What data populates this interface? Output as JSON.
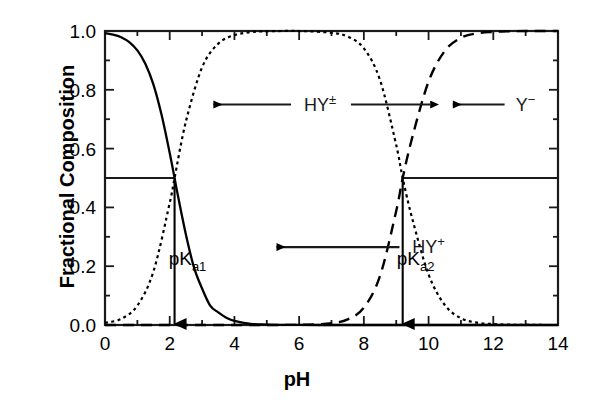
{
  "chart_data": {
    "type": "line",
    "title": "",
    "xlabel": "pH",
    "ylabel": "Fractional Composition",
    "xlim": [
      0,
      14
    ],
    "ylim": [
      0.0,
      1.0
    ],
    "xticks": [
      0,
      2,
      4,
      6,
      8,
      10,
      12,
      14
    ],
    "xtick_labels": [
      "0",
      "2",
      "4",
      "6",
      "8",
      "10",
      "12",
      "14"
    ],
    "yticks": [
      0.0,
      0.2,
      0.4,
      0.6,
      0.8,
      1.0
    ],
    "ytick_labels": [
      "0.0",
      "0.2",
      "0.4",
      "0.6",
      "0.8",
      "1.0"
    ],
    "x_minor_tick_step": 1,
    "y_minor_tick_step": 0.1,
    "grid": false,
    "legend": "none",
    "pka1": 2.15,
    "pka2": 9.2,
    "half_line_level": 0.5,
    "series": [
      {
        "name": "HY+",
        "label": "HY",
        "charge": "+",
        "style": "solid",
        "color": "#000000",
        "x": [
          0.0,
          0.25,
          0.5,
          0.75,
          1.0,
          1.25,
          1.5,
          1.75,
          2.0,
          2.15,
          2.25,
          2.5,
          2.75,
          3.0,
          3.25,
          3.5,
          3.75,
          4.0,
          4.5,
          5.0,
          5.5,
          6.0,
          7.0,
          8.0,
          9.0,
          10.0,
          11.0,
          12.0,
          13.0,
          14.0
        ],
        "values": [
          0.993,
          0.988,
          0.979,
          0.962,
          0.934,
          0.888,
          0.817,
          0.714,
          0.585,
          0.5,
          0.442,
          0.308,
          0.196,
          0.124,
          0.066,
          0.043,
          0.025,
          0.014,
          0.004,
          0.0015,
          0.0004,
          0.0001,
          0.0,
          0.0,
          0.0,
          0.0,
          0.0,
          0.0,
          0.0,
          0.0
        ]
      },
      {
        "name": "HY±",
        "label": "HY",
        "charge": "±",
        "style": "dotted",
        "color": "#000000",
        "x": [
          0.0,
          0.5,
          1.0,
          1.5,
          2.0,
          2.15,
          2.5,
          3.0,
          3.5,
          4.0,
          4.5,
          5.0,
          6.0,
          7.0,
          7.5,
          8.0,
          8.5,
          9.0,
          9.2,
          9.5,
          10.0,
          10.5,
          11.0,
          11.5,
          12.0,
          12.5,
          13.0,
          14.0
        ],
        "values": [
          0.007,
          0.021,
          0.066,
          0.183,
          0.415,
          0.5,
          0.692,
          0.876,
          0.957,
          0.986,
          0.996,
          0.999,
          1.0,
          0.994,
          0.981,
          0.941,
          0.833,
          0.612,
          0.5,
          0.36,
          0.172,
          0.068,
          0.023,
          0.008,
          0.003,
          0.001,
          0.0003,
          0.0
        ],
        "plateau_range": [
          5.0,
          7.0
        ]
      },
      {
        "name": "Y-",
        "label": "Y",
        "charge": "−",
        "style": "dashed",
        "color": "#000000",
        "x": [
          0.0,
          2.0,
          4.0,
          5.0,
          6.0,
          6.5,
          7.0,
          7.5,
          8.0,
          8.5,
          9.0,
          9.2,
          9.5,
          10.0,
          10.5,
          11.0,
          11.5,
          12.0,
          12.5,
          13.0,
          13.5,
          14.0
        ],
        "values": [
          0.0,
          0.0,
          0.0,
          0.0001,
          0.0006,
          0.002,
          0.006,
          0.019,
          0.059,
          0.167,
          0.388,
          0.5,
          0.64,
          0.828,
          0.932,
          0.977,
          0.992,
          0.997,
          0.999,
          1.0,
          1.0,
          1.0
        ]
      }
    ],
    "annotations": [
      {
        "id": "hy-plus",
        "text": "HY",
        "charge": "+",
        "x_label": 10.0,
        "y_label": 0.265,
        "arrow_from_x": 9.1,
        "arrow_to_x": 5.3,
        "direction": "left"
      },
      {
        "id": "hy-zwitter",
        "text": "HY",
        "charge": "±",
        "x_label": 6.65,
        "y_label": 0.75,
        "arrow_left_from_x": 5.75,
        "arrow_left_to_x": 3.35,
        "arrow_right_from_x": 7.6,
        "arrow_right_to_x": 10.05,
        "direction": "both"
      },
      {
        "id": "y-minus",
        "text": "Y",
        "charge": "−",
        "x_label": 13.0,
        "y_label": 0.75,
        "arrow_from_x": 12.35,
        "arrow_to_x": 10.75,
        "direction": "left"
      },
      {
        "id": "pka1",
        "text": "pK",
        "sub": "a1",
        "x_label": 2.55,
        "y_label": 0.205,
        "arrow_x": 2.15,
        "arrow_from_y": 0.5,
        "arrow_to_y": 0.0,
        "direction": "down"
      },
      {
        "id": "pka2",
        "text": "pK",
        "sub": "a2",
        "x_label": 9.6,
        "y_label": 0.205,
        "arrow_x": 9.2,
        "arrow_from_y": 0.5,
        "arrow_to_y": 0.0,
        "direction": "down"
      }
    ]
  },
  "axis": {
    "x_title": "pH",
    "y_title": "Fractional Composition"
  }
}
